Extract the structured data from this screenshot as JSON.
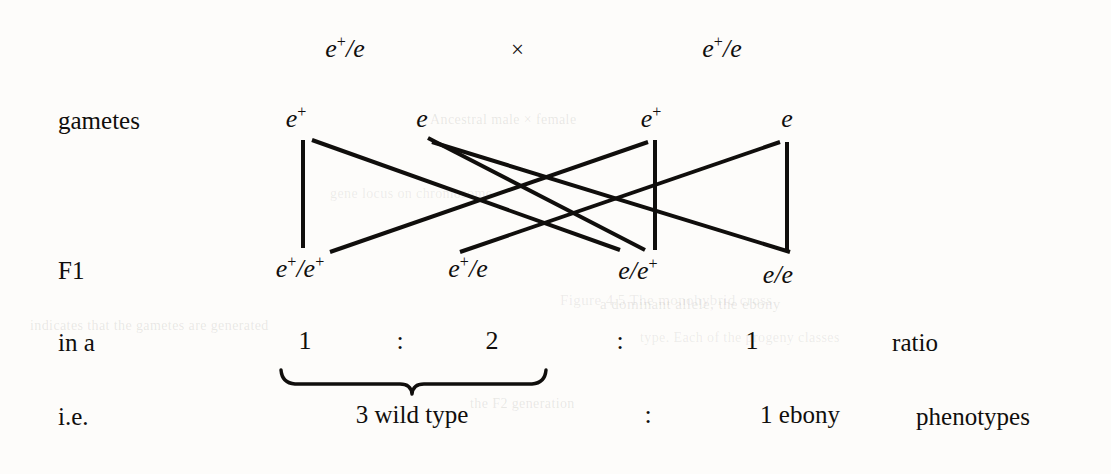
{
  "figure": {
    "type": "punnett-cross-diagram",
    "ink_color": "#100e0c",
    "background_color": "#fdfcfa"
  },
  "parents": {
    "left_genotype": "e",
    "left_superscript": "+",
    "left_second": "/e",
    "cross_symbol": "×",
    "right_genotype": "e",
    "right_superscript": "+",
    "right_second": "/e"
  },
  "rows": {
    "gametes_label": "gametes",
    "f1_label": "F1",
    "ratio_label": "in a",
    "ie_label": "i.e."
  },
  "gametes": [
    {
      "base": "e",
      "sup": "+",
      "x": 296
    },
    {
      "base": "e",
      "sup": "",
      "x": 422
    },
    {
      "base": "e",
      "sup": "+",
      "x": 651
    },
    {
      "base": "e",
      "sup": "",
      "x": 787
    }
  ],
  "f1_genotypes": [
    {
      "text": "e",
      "sup1": "+",
      "mid": "/e",
      "sup2": "+",
      "x": 300
    },
    {
      "text": "e",
      "sup1": "+",
      "mid": "/e",
      "sup2": "",
      "x": 468
    },
    {
      "text": "e",
      "sup1": "",
      "mid": "/e",
      "sup2": "+",
      "x": 638
    },
    {
      "text": "e",
      "sup1": "",
      "mid": "/e",
      "sup2": "",
      "x": 778
    }
  ],
  "ratio_row": {
    "values": [
      "1",
      "2",
      "1"
    ],
    "separators": [
      ":",
      ":"
    ],
    "trailing_word": "ratio"
  },
  "phenotype_row": {
    "left_phenotype": "3 wild type",
    "separator": ":",
    "right_phenotype": "1 ebony",
    "trailing_word": "phenotypes"
  },
  "chart_data": {
    "type": "diagram",
    "genotypic_ratio": {
      "categories": [
        "e+/e+",
        "e+/e",
        "e/e+",
        "e/e"
      ],
      "values": [
        1,
        1,
        1,
        1
      ],
      "summary": "1 : 2 : 1"
    },
    "phenotypic_ratio": {
      "categories": [
        "wild type",
        "ebony"
      ],
      "values": [
        3,
        1
      ],
      "summary": "3 : 1"
    }
  },
  "ghost_text": [
    {
      "t": "Ancestral male × female",
      "x": 430,
      "y": 112,
      "s": 14
    },
    {
      "t": "gene locus on chromosome",
      "x": 330,
      "y": 186,
      "s": 14
    },
    {
      "t": "a dominant allele, the ebony",
      "x": 600,
      "y": 296,
      "s": 15
    },
    {
      "t": "Figure 4.5  The monohybrid cross",
      "x": 560,
      "y": 292,
      "s": 15
    },
    {
      "t": "indicates that the gametes are generated",
      "x": 30,
      "y": 318,
      "s": 14
    },
    {
      "t": "type. Each of the progeny classes",
      "x": 640,
      "y": 330,
      "s": 14
    },
    {
      "t": "the F2 generation",
      "x": 470,
      "y": 396,
      "s": 14
    }
  ]
}
